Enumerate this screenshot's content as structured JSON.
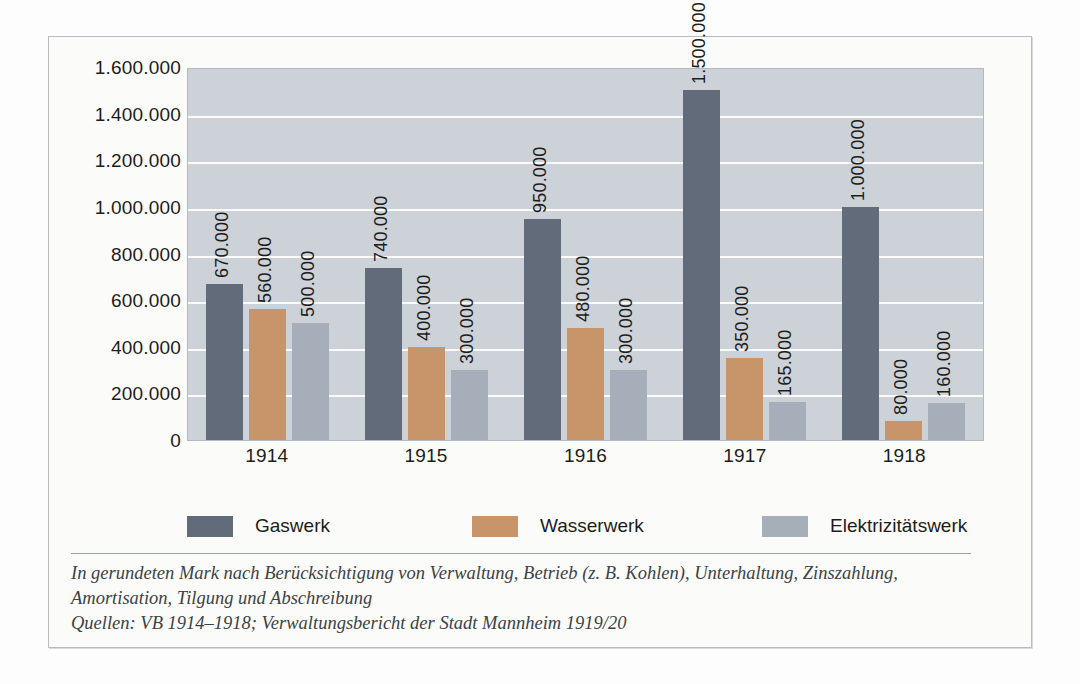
{
  "chart_data": {
    "type": "bar",
    "title": "",
    "subtitle": "",
    "xlabel": "",
    "ylabel": "",
    "categories": [
      "1914",
      "1915",
      "1916",
      "1917",
      "1918"
    ],
    "series": [
      {
        "name": "Gaswerk",
        "color": "#626b79",
        "values": [
          670000,
          740000,
          950000,
          1500000,
          1000000
        ],
        "labels": [
          "670.000",
          "740.000",
          "950.000",
          "1.500.000",
          "1.000.000"
        ]
      },
      {
        "name": "Wasserwerk",
        "color": "#c8946a",
        "values": [
          560000,
          400000,
          480000,
          350000,
          80000
        ],
        "labels": [
          "560.000",
          "400.000",
          "480.000",
          "350.000",
          "80.000"
        ]
      },
      {
        "name": "Elektrizitätswerk",
        "color": "#a6aeba",
        "values": [
          500000,
          300000,
          300000,
          165000,
          160000
        ],
        "labels": [
          "500.000",
          "300.000",
          "300.000",
          "165.000",
          "160.000"
        ]
      }
    ],
    "ylim": [
      0,
      1600000
    ],
    "yticks": [
      0,
      200000,
      400000,
      600000,
      800000,
      1000000,
      1200000,
      1400000,
      1600000
    ],
    "ytick_labels": [
      "0",
      "200.000",
      "400.000",
      "600.000",
      "800.000",
      "1.000.000",
      "1.200.000",
      "1.400.000",
      "1.600.000"
    ],
    "grid": true,
    "legend_position": "bottom",
    "plot_background": "#ccd2d7",
    "gridline_color": "#fbfbfb"
  },
  "legend": {
    "items": [
      {
        "label": "Gaswerk",
        "color": "#626b79"
      },
      {
        "label": "Wasserwerk",
        "color": "#c8946a"
      },
      {
        "label": "Elektrizitätswerk",
        "color": "#a6aeba"
      }
    ]
  },
  "footnote": {
    "line1": "In gerundeten Mark nach Berücksichtigung von Verwaltung, Betrieb (z. B. Kohlen), Unterhaltung, Zinszahlung,",
    "line2": "Amortisation, Tilgung und Abschreibung",
    "line3": "Quellen: VB 1914–1918; Verwaltungsbericht der Stadt Mannheim 1919/20"
  }
}
